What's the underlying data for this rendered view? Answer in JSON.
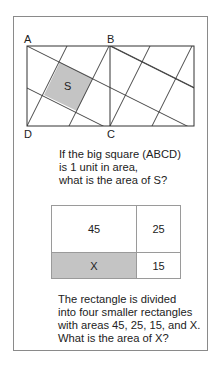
{
  "figure1": {
    "labels": {
      "A": "A",
      "B": "B",
      "C": "C",
      "D": "D",
      "S": "S"
    },
    "shaded_color": "#c4c4c4"
  },
  "question1": {
    "lines": [
      "If the big square (ABCD)",
      "is 1 unit in area,",
      "what is the area of S?"
    ]
  },
  "figure2": {
    "cells": [
      {
        "label": "45",
        "shaded": false
      },
      {
        "label": "25",
        "shaded": false
      },
      {
        "label": "X",
        "shaded": true
      },
      {
        "label": "15",
        "shaded": false
      }
    ],
    "shaded_color": "#c4c4c4"
  },
  "question2": {
    "lines": [
      "The rectangle is divided",
      "into four smaller rectangles",
      "with areas 45, 25, 15, and X.",
      "What is the area of X?"
    ]
  }
}
